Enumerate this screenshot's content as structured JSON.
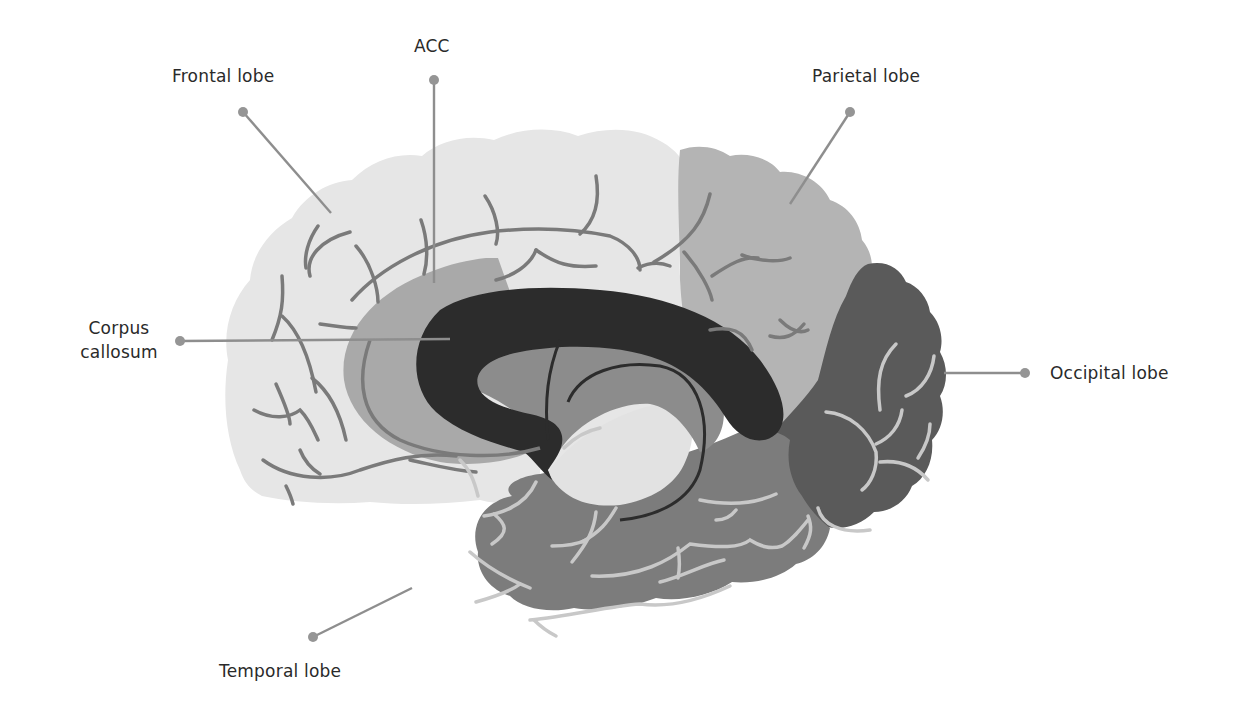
{
  "diagram": {
    "colors": {
      "frontal": "#e6e6e6",
      "parietal": "#b4b4b4",
      "occipital": "#5a5a5a",
      "temporal": "#7c7c7c",
      "acc": "#a9a9a9",
      "corpus_callosum": "#2c2c2c",
      "inner_region": "#8c8c8c",
      "sulci_dark": "#7a7a7a",
      "sulci_light": "#c8c8c8",
      "leader_line": "#8e8e8e",
      "text": "#2a2a2a"
    },
    "labels": [
      {
        "id": "frontal",
        "text": "Frontal lobe"
      },
      {
        "id": "acc",
        "text": "ACC"
      },
      {
        "id": "parietal",
        "text": "Parietal lobe"
      },
      {
        "id": "corpus_line1",
        "text": "Corpus"
      },
      {
        "id": "corpus_line2",
        "text": "callosum"
      },
      {
        "id": "occipital",
        "text": "Occipital lobe"
      },
      {
        "id": "temporal",
        "text": "Temporal lobe"
      }
    ]
  }
}
